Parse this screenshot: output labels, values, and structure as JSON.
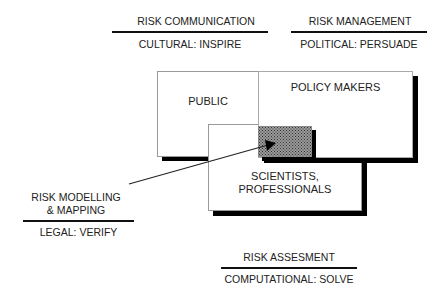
{
  "top_left": {
    "heading": "RISK COMMUNICATION",
    "sub": "CULTURAL: INSPIRE"
  },
  "top_right": {
    "heading": "RISK MANAGEMENT",
    "sub": "POLITICAL: PERSUADE"
  },
  "left": {
    "heading_line1": "RISK MODELLING",
    "heading_line2": "& MAPPING",
    "sub": "LEGAL: VERIFY"
  },
  "bottom": {
    "heading": "RISK ASSESMENT",
    "sub": "COMPUTATIONAL: SOLVE"
  },
  "boxes": {
    "public": "PUBLIC",
    "policy_makers": "POLICY MAKERS",
    "scientists_line1": "SCIENTISTS,",
    "scientists_line2": "PROFESSIONALS"
  },
  "colors": {
    "shadow": "#000000",
    "border": "#999999",
    "hatch": "#9a9a9a"
  }
}
